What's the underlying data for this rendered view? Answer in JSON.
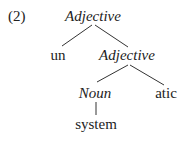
{
  "example": {
    "number": "(2)"
  },
  "tree": {
    "root": {
      "label": "Adjective",
      "italic": true
    },
    "un": {
      "label": "un",
      "italic": false
    },
    "adj2": {
      "label": "Adjective",
      "italic": true
    },
    "noun": {
      "label": "Noun",
      "italic": true
    },
    "atic": {
      "label": "atic",
      "italic": false
    },
    "system": {
      "label": "system",
      "italic": false
    }
  },
  "colors": {
    "text": "#222222",
    "lines": "#333333",
    "background": "#ffffff"
  }
}
